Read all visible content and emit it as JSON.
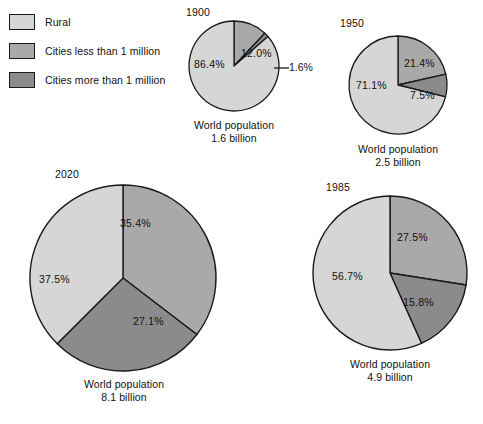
{
  "legend": {
    "items": [
      {
        "label": "Rural",
        "color": "#d6d6d6",
        "key": "rural"
      },
      {
        "label": "Cities less than 1 million",
        "color": "#a9a9a9",
        "key": "cities_lt_1m"
      },
      {
        "label": "Cities more than 1 million",
        "color": "#8b8b8b",
        "key": "cities_gt_1m"
      }
    ]
  },
  "chart_data": {
    "type": "pie",
    "legend_position": "top-left",
    "categories": [
      "Rural",
      "Cities less than 1 million",
      "Cities more than 1 million"
    ],
    "colors": [
      "#d6d6d6",
      "#a9a9a9",
      "#8b8b8b"
    ],
    "charts": [
      {
        "id": "pie-1900",
        "year": "1900",
        "caption_line1": "World population",
        "caption_line2": "1.6 billion",
        "population_billions": 1.6,
        "values": [
          86.4,
          12.0,
          1.6
        ],
        "labels": [
          "86.4%",
          "12.0%",
          "1.6%"
        ]
      },
      {
        "id": "pie-1950",
        "year": "1950",
        "caption_line1": "World population",
        "caption_line2": "2.5 billion",
        "population_billions": 2.5,
        "values": [
          71.1,
          21.4,
          7.5
        ],
        "labels": [
          "71.1%",
          "21.4%",
          "7.5%"
        ]
      },
      {
        "id": "pie-1985",
        "year": "1985",
        "caption_line1": "World population",
        "caption_line2": "4.9 billion",
        "population_billions": 4.9,
        "values": [
          56.7,
          27.5,
          15.8
        ],
        "labels": [
          "56.7%",
          "27.5%",
          "15.8%"
        ]
      },
      {
        "id": "pie-2020",
        "year": "2020",
        "caption_line1": "World population",
        "caption_line2": "8.1 billion",
        "population_billions": 8.1,
        "values": [
          37.5,
          35.4,
          27.1
        ],
        "labels": [
          "37.5%",
          "35.4%",
          "27.1%"
        ]
      }
    ]
  }
}
